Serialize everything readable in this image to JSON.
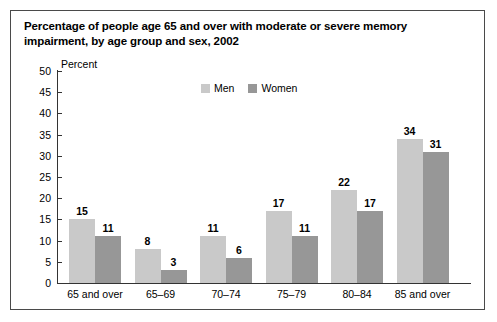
{
  "figure": {
    "title": "Percentage of people age 65 and over with moderate or severe memory impairment, by age group and sex, 2002"
  },
  "colors": {
    "men_bar": "#c9c9c9",
    "women_bar": "#979797",
    "axis": "#333333",
    "border": "#4a4a4a"
  },
  "chart_data": {
    "type": "bar",
    "title": "Percentage of people age 65 and over with moderate or severe memory impairment, by age group and sex, 2002",
    "xlabel": "",
    "ylabel": "Percent",
    "ylim": [
      0,
      50
    ],
    "yticks": [
      0,
      5,
      10,
      15,
      20,
      25,
      30,
      35,
      40,
      45,
      50
    ],
    "grid": false,
    "legend_position": "top-center",
    "categories": [
      "65 and over",
      "65–69",
      "70–74",
      "75–79",
      "80–84",
      "85 and over"
    ],
    "series": [
      {
        "name": "Men",
        "color": "#c9c9c9",
        "values": [
          15,
          8,
          11,
          17,
          22,
          34
        ]
      },
      {
        "name": "Women",
        "color": "#979797",
        "values": [
          11,
          3,
          6,
          11,
          17,
          31
        ]
      }
    ]
  }
}
